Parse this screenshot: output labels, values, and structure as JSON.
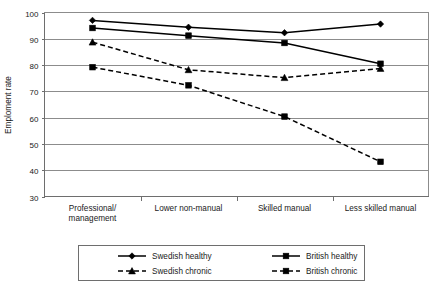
{
  "chart_data": {
    "type": "line",
    "title": "",
    "xlabel": "",
    "ylabel": "Emploment rate",
    "ylim": [
      30,
      100
    ],
    "ytick_step": 10,
    "yticks": [
      "100",
      "90",
      "80",
      "70",
      "60",
      "50",
      "40",
      "30"
    ],
    "grid": true,
    "legend_position": "bottom",
    "categories": [
      "Professional/ management",
      "Lower non-manual",
      "Skilled manual",
      "Less skilled manual"
    ],
    "category_lines": [
      [
        "Professional/",
        "management"
      ],
      [
        "Lower non-manual"
      ],
      [
        "Skilled manual"
      ],
      [
        "Less skilled manual"
      ]
    ],
    "series": [
      {
        "name": "Swedish healthy",
        "marker": "diamond",
        "style": "solid",
        "color": "#000000",
        "values": [
          97.0,
          94.4,
          92.3,
          95.6
        ]
      },
      {
        "name": "British healthy",
        "marker": "square",
        "style": "solid",
        "color": "#000000",
        "values": [
          94.1,
          91.2,
          88.4,
          80.5
        ]
      },
      {
        "name": "Swedish chronic",
        "marker": "triangle",
        "style": "dashed",
        "color": "#000000",
        "values": [
          88.7,
          78.2,
          75.2,
          78.7
        ]
      },
      {
        "name": "British chronic",
        "marker": "square",
        "style": "dashed",
        "color": "#000000",
        "values": [
          79.2,
          72.3,
          60.4,
          43.2
        ]
      }
    ]
  },
  "legend": {
    "entries": [
      {
        "label": "Swedish healthy",
        "marker": "diamond",
        "style": "solid"
      },
      {
        "label": "British healthy",
        "marker": "square",
        "style": "solid"
      },
      {
        "label": "Swedish chronic",
        "marker": "triangle",
        "style": "dashed"
      },
      {
        "label": "British chronic",
        "marker": "square",
        "style": "dashed"
      }
    ]
  },
  "colors": {
    "ink": "#000000",
    "grid": "#8c8c8c",
    "axis": "#6e6e6e",
    "background": "#ffffff"
  }
}
